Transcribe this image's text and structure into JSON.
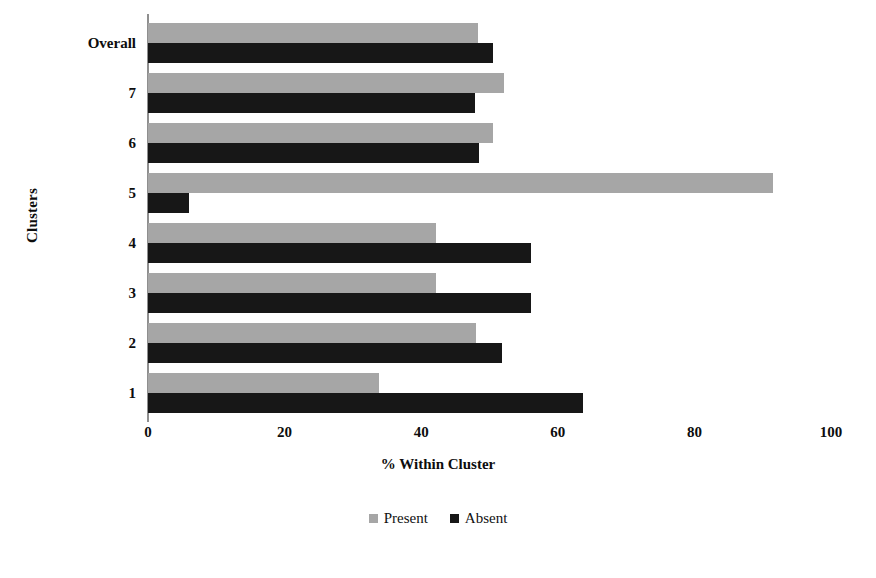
{
  "chart_data": {
    "type": "bar",
    "orientation": "horizontal",
    "title": "",
    "xlabel": "% Within Cluster",
    "ylabel": "Clusters",
    "xlim": [
      0,
      100
    ],
    "xticks": [
      0,
      20,
      40,
      60,
      80,
      100
    ],
    "xtick_labels": [
      "0",
      "20",
      "40",
      "60",
      "80",
      "100"
    ],
    "grid": false,
    "legend_position": "bottom",
    "categories": [
      "1",
      "2",
      "3",
      "4",
      "5",
      "6",
      "7",
      "Overall"
    ],
    "series": [
      {
        "name": "Present",
        "color": "#a6a6a6",
        "values": [
          33.8,
          48.0,
          42.2,
          42.2,
          91.5,
          50.5,
          52.1,
          48.3
        ]
      },
      {
        "name": "Absent",
        "color": "#171717",
        "values": [
          63.7,
          51.8,
          56.1,
          56.1,
          6.0,
          48.5,
          47.9,
          50.5
        ]
      }
    ]
  },
  "legend": {
    "items": [
      {
        "label": "Present",
        "swatch": "present-swatch"
      },
      {
        "label": "Absent",
        "swatch": "absent-swatch"
      }
    ]
  }
}
